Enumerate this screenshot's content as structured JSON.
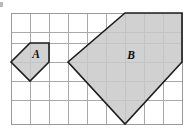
{
  "figure": {
    "background_color": "#ffffff",
    "grid": {
      "name": "square-grid",
      "columns": 9,
      "rows": 6,
      "cell_size_px": 19,
      "origin_x_px": 11,
      "origin_y_px": 13,
      "line_color": "#a9a9a9",
      "border_color": "#9a9a9a"
    },
    "style": {
      "fill_color": "#c9c9c9",
      "outline_color": "#1c1c1c",
      "label_color": "#0d0d0d"
    },
    "shapes": [
      {
        "name": "shape-a",
        "label": "A",
        "label_x": 36,
        "label_y": 55,
        "vertex_count": 5,
        "grid_units_wide": 2,
        "grid_units_tall": 2,
        "points": "30,43 49,43 49,62 30,81 11,62",
        "description": "Pentagon spanning 2 by 2 grid cells with the upper-left corner cut off"
      },
      {
        "name": "shape-b",
        "label": "B",
        "label_x": 131,
        "label_y": 56,
        "vertex_count": 5,
        "grid_units_wide": 4,
        "grid_units_tall": 4,
        "points": "125,13 182,13 182,62 125,124 68,62",
        "description": "Pentagon spanning 4 by 4 grid cells, a 2 times enlargement of shape A"
      }
    ]
  }
}
